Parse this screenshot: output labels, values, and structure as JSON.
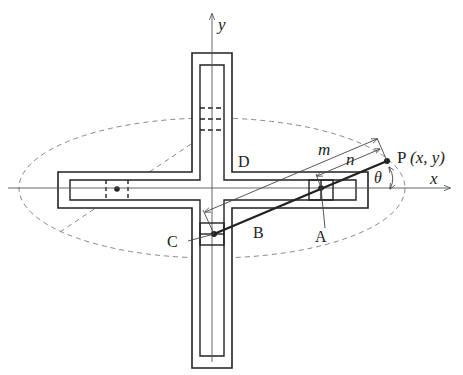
{
  "diagram": {
    "axes": {
      "x_label": "x",
      "y_label": "y"
    },
    "points": {
      "P_label": "P",
      "P_coords": "(x, y)",
      "A_label": "A",
      "B_label": "B",
      "C_label": "C",
      "D_label": "D"
    },
    "dimensions": {
      "m_label": "m",
      "n_label": "n",
      "theta_label": "θ"
    },
    "colors": {
      "stroke": "#222222",
      "dashed": "#888888",
      "axis": "#555555"
    }
  }
}
